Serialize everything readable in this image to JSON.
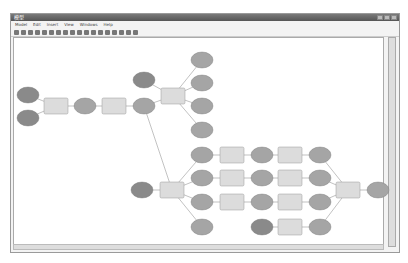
{
  "window": {
    "title": "模型"
  },
  "menu": [
    "Model",
    "Edit",
    "Insert",
    "View",
    "Windows",
    "Help"
  ],
  "toolbar_icons": [
    "save-icon",
    "print-icon",
    "cut-icon",
    "copy-icon",
    "paste-icon",
    "delete-icon",
    "undo-icon",
    "redo-icon",
    "add-data-icon",
    "auto-layout-icon",
    "full-extent-icon",
    "zoom-in-icon",
    "zoom-out-icon",
    "pan-icon",
    "select-icon",
    "connect-icon",
    "validate-icon",
    "run-icon"
  ],
  "colors": {
    "input_oval": "#8a8a8a",
    "output_oval": "#a5a5a5",
    "tool_rect": "#dcdcdc",
    "connector": "#999999"
  },
  "diagram": {
    "ovals": [
      {
        "x": 28,
        "y": 95,
        "dark": true
      },
      {
        "x": 28,
        "y": 118,
        "dark": true
      },
      {
        "x": 85,
        "y": 106
      },
      {
        "x": 144,
        "y": 106
      },
      {
        "x": 144,
        "y": 80,
        "dark": true
      },
      {
        "x": 202,
        "y": 60
      },
      {
        "x": 202,
        "y": 83
      },
      {
        "x": 202,
        "y": 106
      },
      {
        "x": 202,
        "y": 130
      },
      {
        "x": 142,
        "y": 190,
        "dark": true
      },
      {
        "x": 202,
        "y": 155
      },
      {
        "x": 202,
        "y": 178
      },
      {
        "x": 202,
        "y": 202
      },
      {
        "x": 202,
        "y": 227
      },
      {
        "x": 262,
        "y": 155
      },
      {
        "x": 262,
        "y": 178
      },
      {
        "x": 262,
        "y": 202
      },
      {
        "x": 262,
        "y": 227,
        "dark": true
      },
      {
        "x": 320,
        "y": 155
      },
      {
        "x": 320,
        "y": 178
      },
      {
        "x": 320,
        "y": 202
      },
      {
        "x": 320,
        "y": 227
      },
      {
        "x": 378,
        "y": 190
      }
    ],
    "rects": [
      {
        "x": 56,
        "y": 106
      },
      {
        "x": 114,
        "y": 106
      },
      {
        "x": 173,
        "y": 96
      },
      {
        "x": 172,
        "y": 190
      },
      {
        "x": 232,
        "y": 155
      },
      {
        "x": 232,
        "y": 178
      },
      {
        "x": 232,
        "y": 202
      },
      {
        "x": 290,
        "y": 155
      },
      {
        "x": 290,
        "y": 178
      },
      {
        "x": 290,
        "y": 202
      },
      {
        "x": 290,
        "y": 227
      },
      {
        "x": 348,
        "y": 190
      }
    ]
  }
}
